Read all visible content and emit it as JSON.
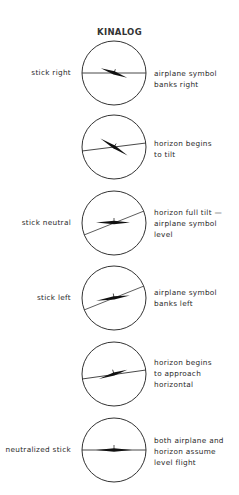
{
  "title": "KINALOG",
  "frames": [
    {
      "left_label": "stick right",
      "right_label": "airplane symbol\nbanks right",
      "horizon_angle": 0,
      "plane_angle": 20
    },
    {
      "left_label": "",
      "right_label": "horizon begins\nto tilt",
      "horizon_angle": -8,
      "plane_angle": 30
    },
    {
      "left_label": "stick neutral",
      "right_label": "horizon full tilt —\nairplane symbol\nlevel",
      "horizon_angle": -22,
      "plane_angle": 0
    },
    {
      "left_label": "stick left",
      "right_label": "airplane symbol\nbanks left",
      "horizon_angle": -22,
      "plane_angle": -10
    },
    {
      "left_label": "",
      "right_label": "horizon begins\nto approach\nhorizontal",
      "horizon_angle": -8,
      "plane_angle": -18
    },
    {
      "left_label": "neutralized stick",
      "right_label": "both airplane and\nhorizon assume\nlevel flight",
      "horizon_angle": 0,
      "plane_angle": 0
    }
  ]
}
